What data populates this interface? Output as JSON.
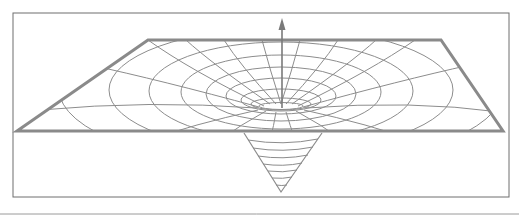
{
  "diagram": {
    "kind": "gravity-well",
    "colors": {
      "background": "#ffffff",
      "frame": "#6e6e6e",
      "plane_edge": "#8a8a8a",
      "grid": "#8c8c8c",
      "arrow": "#7a7a7a",
      "bottom_rule": "#9a9a9a"
    },
    "frame": {
      "x": 13,
      "y": 13,
      "width": 496,
      "height": 184
    },
    "plane": {
      "top_left": [
        148,
        40
      ],
      "top_right": [
        441,
        40
      ],
      "bottom_right": [
        503,
        131
      ],
      "bottom_left": [
        17,
        131
      ]
    },
    "center": [
      281,
      108
    ],
    "arrow": {
      "x": 282,
      "y_top": 20,
      "y_bottom": 108
    },
    "cone": {
      "left": [
        244,
        133
      ],
      "right": [
        322,
        133
      ],
      "tip": [
        281,
        192
      ],
      "rings": 7
    },
    "bottom_rule_y": 214
  }
}
